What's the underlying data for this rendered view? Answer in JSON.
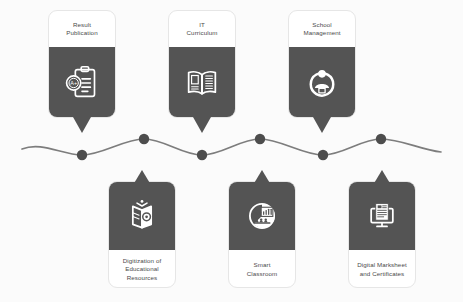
{
  "diagram": {
    "type": "wavy-timeline-infographic",
    "colors": {
      "background": "#fbfbfb",
      "card_dark": "#545454",
      "card_light": "#ffffff",
      "text": "#4a4a4a",
      "wave_line": "#7d7d7d",
      "node_dot": "#4d4d4d"
    }
  },
  "top_cards": [
    {
      "id": "result-publication",
      "label_lines": [
        "Result",
        "Publication"
      ],
      "icon": "clipboard-grade-icon",
      "icon_detail": "A+",
      "x": 48,
      "y": 10
    },
    {
      "id": "it-curriculum",
      "label_lines": [
        "IT",
        "Curriculum"
      ],
      "icon": "open-book-icon",
      "icon_detail": "",
      "x": 168,
      "y": 10
    },
    {
      "id": "school-management",
      "label_lines": [
        "School",
        "Management"
      ],
      "icon": "person-circle-icon",
      "icon_detail": "",
      "x": 288,
      "y": 10
    }
  ],
  "bottom_cards": [
    {
      "id": "digitization-educational-resources",
      "label_lines": [
        "Digitization of",
        "Educational",
        "Resources"
      ],
      "icon": "digital-book-icon",
      "icon_detail": "",
      "x": 108,
      "y": 170
    },
    {
      "id": "smart-classroom",
      "label_lines": [
        "Smart",
        "Classroom"
      ],
      "icon": "smart-classroom-icon",
      "icon_detail": "",
      "x": 228,
      "y": 170
    },
    {
      "id": "digital-marksheet-certificates",
      "label_lines": [
        "Digital Marksheet",
        "and Certificates"
      ],
      "icon": "monitor-document-icon",
      "icon_detail": "",
      "x": 348,
      "y": 170
    }
  ],
  "timeline": {
    "wave_path": "M 22,149 C 42,141 62,155 82,155 C 102,155 124,139 144,139 C 164,139 182,155 202,155 C 222,155 240,139 260,139 C 280,139 303,155 323,155 C 343,155 361,139 381,139 C 401,139 421,150 441,152",
    "nodes": [
      {
        "id": "node-1",
        "x": 82,
        "y": 155,
        "r": 5.2
      },
      {
        "id": "node-2",
        "x": 144,
        "y": 139,
        "r": 5.2
      },
      {
        "id": "node-3",
        "x": 202,
        "y": 155,
        "r": 5.2
      },
      {
        "id": "node-4",
        "x": 260,
        "y": 139,
        "r": 5.2
      },
      {
        "id": "node-5",
        "x": 323,
        "y": 155,
        "r": 5.2
      },
      {
        "id": "node-6",
        "x": 381,
        "y": 139,
        "r": 5.2
      }
    ]
  }
}
